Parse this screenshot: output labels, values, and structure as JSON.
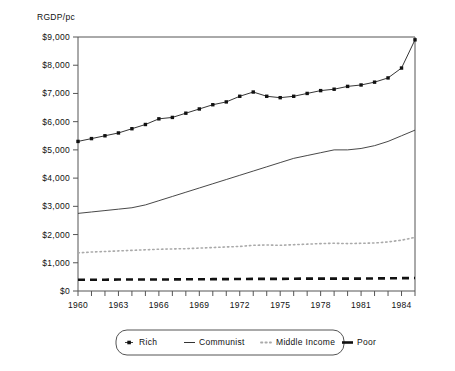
{
  "chart_data": {
    "type": "line",
    "title": "",
    "ylabel": "RGDP/pc",
    "xlabel": "",
    "ylim": [
      0,
      9000
    ],
    "xlim": [
      1960,
      1985
    ],
    "grid": false,
    "legend_position": "bottom",
    "y_ticks": [
      0,
      1000,
      2000,
      3000,
      4000,
      5000,
      6000,
      7000,
      8000,
      9000
    ],
    "y_tick_labels": [
      "$0",
      "$1,000",
      "$2,000",
      "$3,000",
      "$4,000",
      "$5,000",
      "$6,000",
      "$7,000",
      "$8,000",
      "$9,000"
    ],
    "x_ticks": [
      1960,
      1961,
      1962,
      1963,
      1964,
      1965,
      1966,
      1967,
      1968,
      1969,
      1970,
      1971,
      1972,
      1973,
      1974,
      1975,
      1976,
      1977,
      1978,
      1979,
      1980,
      1981,
      1982,
      1983,
      1984,
      1985
    ],
    "x_tick_labels": [
      "1960",
      "",
      "",
      "1963",
      "",
      "",
      "1966",
      "",
      "",
      "1969",
      "",
      "",
      "1972",
      "",
      "",
      "1975",
      "",
      "",
      "1978",
      "",
      "",
      "1981",
      "",
      "",
      "1984",
      ""
    ],
    "x": [
      1960,
      1961,
      1962,
      1963,
      1964,
      1965,
      1966,
      1967,
      1968,
      1969,
      1970,
      1971,
      1972,
      1973,
      1974,
      1975,
      1976,
      1977,
      1978,
      1979,
      1980,
      1981,
      1982,
      1983,
      1984,
      1985
    ],
    "series": [
      {
        "name": "Rich",
        "style": "dotted-with-markers",
        "color": "#111111",
        "values": [
          5300,
          5400,
          5500,
          5600,
          5750,
          5900,
          6100,
          6150,
          6300,
          6450,
          6600,
          6700,
          6900,
          7050,
          6900,
          6850,
          6900,
          7000,
          7100,
          7150,
          7250,
          7300,
          7400,
          7550,
          7900,
          8900
        ]
      },
      {
        "name": "Communist",
        "style": "solid-thin",
        "color": "#333333",
        "values": [
          2750,
          2800,
          2850,
          2900,
          2950,
          3050,
          3200,
          3350,
          3500,
          3650,
          3800,
          3950,
          4100,
          4250,
          4400,
          4550,
          4700,
          4800,
          4900,
          5000,
          5000,
          5050,
          5150,
          5300,
          5500,
          5700
        ]
      },
      {
        "name": "Middle Income",
        "style": "dotted",
        "color": "#aaaaaa",
        "values": [
          1350,
          1380,
          1400,
          1420,
          1440,
          1460,
          1480,
          1490,
          1500,
          1520,
          1540,
          1560,
          1580,
          1620,
          1630,
          1620,
          1640,
          1660,
          1680,
          1690,
          1680,
          1690,
          1700,
          1740,
          1800,
          1900
        ]
      },
      {
        "name": "Poor",
        "style": "dashed-thick",
        "color": "#111111",
        "values": [
          400,
          400,
          400,
          405,
          405,
          410,
          410,
          410,
          415,
          415,
          420,
          420,
          425,
          430,
          430,
          430,
          435,
          440,
          440,
          440,
          440,
          440,
          445,
          450,
          455,
          460
        ]
      }
    ],
    "legend_entries": [
      {
        "label": "Rich",
        "marker": "square-dot"
      },
      {
        "label": "Communist",
        "marker": "solid-line"
      },
      {
        "label": "Middle Income",
        "marker": "dotted-line"
      },
      {
        "label": "Poor",
        "marker": "thick-dash"
      }
    ]
  }
}
